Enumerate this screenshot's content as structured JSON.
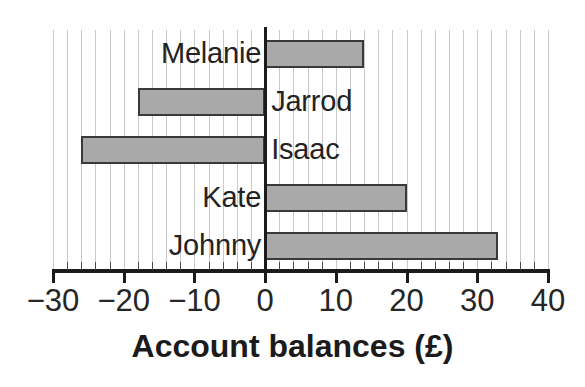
{
  "chart_data": {
    "type": "bar",
    "orientation": "horizontal",
    "title": "",
    "xlabel": "Account balances (£)",
    "ylabel": "",
    "categories": [
      "Melanie",
      "Jarrod",
      "Isaac",
      "Kate",
      "Johnny"
    ],
    "values": [
      14,
      -18,
      -26,
      20,
      33
    ],
    "series": [
      {
        "name": "Account balance",
        "values": [
          14,
          -18,
          -26,
          20,
          33
        ]
      }
    ],
    "xlim": [
      -30,
      40
    ],
    "xticks": [
      -30,
      -20,
      -10,
      0,
      10,
      20,
      30,
      40
    ],
    "xticklabels": [
      "−30",
      "−20",
      "−10",
      "0",
      "10",
      "20",
      "30",
      "40"
    ],
    "minor_tick_step": 2,
    "grid": true,
    "grid_axis": "x",
    "legend": false,
    "legend_position": "none",
    "bar_color": "#a9a9a9",
    "bar_edge_color": "#3a3a3a",
    "grid_color": "#c9c9c9",
    "axis_color": "#1b1b1b",
    "zero_line": 0,
    "label_placement": [
      {
        "category": "Melanie",
        "side": "left-of-zero"
      },
      {
        "category": "Jarrod",
        "side": "right-of-zero"
      },
      {
        "category": "Isaac",
        "side": "right-of-zero"
      },
      {
        "category": "Kate",
        "side": "left-of-zero"
      },
      {
        "category": "Johnny",
        "side": "left-of-zero"
      }
    ]
  }
}
